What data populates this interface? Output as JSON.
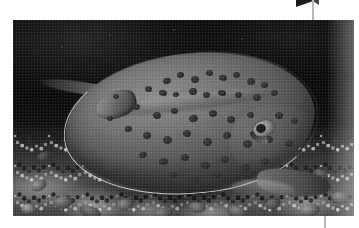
{
  "page": {
    "background_color": "#ffffff",
    "width": 359,
    "height": 228
  },
  "decorations": {
    "corner_rule_color": "#b9b9b9",
    "corner_wedge_color": "#1c1c1c",
    "bottom_rule_color": "#b9b9b9"
  },
  "photo": {
    "name": "blue-spotted-stingray-on-reef",
    "style": "grayscale underwater photograph",
    "frame": {
      "x": 13,
      "y": 20,
      "width": 341,
      "height": 196
    },
    "background_color": "#0a0a0a",
    "subject": {
      "name": "stingray",
      "body_color": "#747474",
      "edge_color": "#e2e2e2",
      "spot_color": "#2a2a2a",
      "eye_color": "#c9c9c9"
    },
    "seabed": {
      "name": "coral-rubble-seabed",
      "color": "#4c4c4c"
    },
    "spots": [
      {
        "x": 150,
        "y": 58,
        "w": 8,
        "h": 6
      },
      {
        "x": 164,
        "y": 52,
        "w": 7,
        "h": 6
      },
      {
        "x": 178,
        "y": 56,
        "w": 8,
        "h": 7
      },
      {
        "x": 193,
        "y": 50,
        "w": 7,
        "h": 6
      },
      {
        "x": 206,
        "y": 55,
        "w": 8,
        "h": 6
      },
      {
        "x": 220,
        "y": 52,
        "w": 7,
        "h": 6
      },
      {
        "x": 234,
        "y": 58,
        "w": 8,
        "h": 7
      },
      {
        "x": 248,
        "y": 62,
        "w": 7,
        "h": 6
      },
      {
        "x": 132,
        "y": 66,
        "w": 7,
        "h": 6
      },
      {
        "x": 146,
        "y": 70,
        "w": 8,
        "h": 6
      },
      {
        "x": 160,
        "y": 72,
        "w": 6,
        "h": 5
      },
      {
        "x": 176,
        "y": 68,
        "w": 8,
        "h": 7
      },
      {
        "x": 190,
        "y": 72,
        "w": 7,
        "h": 6
      },
      {
        "x": 205,
        "y": 70,
        "w": 8,
        "h": 6
      },
      {
        "x": 222,
        "y": 72,
        "w": 7,
        "h": 6
      },
      {
        "x": 240,
        "y": 74,
        "w": 8,
        "h": 7
      },
      {
        "x": 258,
        "y": 70,
        "w": 7,
        "h": 6
      },
      {
        "x": 120,
        "y": 84,
        "w": 7,
        "h": 6
      },
      {
        "x": 140,
        "y": 92,
        "w": 8,
        "h": 7
      },
      {
        "x": 158,
        "y": 88,
        "w": 7,
        "h": 6
      },
      {
        "x": 176,
        "y": 95,
        "w": 9,
        "h": 7
      },
      {
        "x": 196,
        "y": 90,
        "w": 8,
        "h": 7
      },
      {
        "x": 214,
        "y": 96,
        "w": 8,
        "h": 7
      },
      {
        "x": 234,
        "y": 92,
        "w": 7,
        "h": 6
      },
      {
        "x": 262,
        "y": 92,
        "w": 8,
        "h": 7
      },
      {
        "x": 278,
        "y": 98,
        "w": 7,
        "h": 6
      },
      {
        "x": 112,
        "y": 106,
        "w": 7,
        "h": 6
      },
      {
        "x": 130,
        "y": 112,
        "w": 8,
        "h": 7
      },
      {
        "x": 150,
        "y": 116,
        "w": 9,
        "h": 8
      },
      {
        "x": 170,
        "y": 110,
        "w": 8,
        "h": 7
      },
      {
        "x": 190,
        "y": 118,
        "w": 9,
        "h": 8
      },
      {
        "x": 210,
        "y": 112,
        "w": 8,
        "h": 7
      },
      {
        "x": 230,
        "y": 120,
        "w": 9,
        "h": 8
      },
      {
        "x": 252,
        "y": 116,
        "w": 8,
        "h": 7
      },
      {
        "x": 272,
        "y": 120,
        "w": 8,
        "h": 7
      },
      {
        "x": 126,
        "y": 132,
        "w": 8,
        "h": 6
      },
      {
        "x": 146,
        "y": 138,
        "w": 9,
        "h": 7
      },
      {
        "x": 168,
        "y": 134,
        "w": 8,
        "h": 7
      },
      {
        "x": 188,
        "y": 142,
        "w": 9,
        "h": 7
      },
      {
        "x": 208,
        "y": 136,
        "w": 8,
        "h": 7
      },
      {
        "x": 228,
        "y": 144,
        "w": 9,
        "h": 7
      },
      {
        "x": 248,
        "y": 138,
        "w": 8,
        "h": 7
      },
      {
        "x": 156,
        "y": 152,
        "w": 8,
        "h": 6
      },
      {
        "x": 178,
        "y": 156,
        "w": 8,
        "h": 6
      },
      {
        "x": 200,
        "y": 152,
        "w": 8,
        "h": 6
      },
      {
        "x": 94,
        "y": 96,
        "w": 6,
        "h": 5
      },
      {
        "x": 100,
        "y": 74,
        "w": 6,
        "h": 5
      }
    ],
    "specks": [
      {
        "x": 96,
        "y": 14,
        "s": 2
      },
      {
        "x": 160,
        "y": 9,
        "s": 2
      },
      {
        "x": 228,
        "y": 18,
        "s": 2
      },
      {
        "x": 270,
        "y": 12,
        "s": 1
      },
      {
        "x": 48,
        "y": 26,
        "s": 2
      },
      {
        "x": 300,
        "y": 30,
        "s": 1
      }
    ],
    "rubble": [
      {
        "x": 18,
        "y": 160,
        "w": 16,
        "h": 11,
        "c": "#9c9c9c"
      },
      {
        "x": 40,
        "y": 176,
        "w": 20,
        "h": 13,
        "c": "#8a8a8a"
      },
      {
        "x": 8,
        "y": 184,
        "w": 14,
        "h": 10,
        "c": "#b4b4b4"
      },
      {
        "x": 66,
        "y": 186,
        "w": 22,
        "h": 12,
        "c": "#7c7c7c"
      },
      {
        "x": 104,
        "y": 178,
        "w": 18,
        "h": 12,
        "c": "#9a9a9a"
      },
      {
        "x": 140,
        "y": 188,
        "w": 20,
        "h": 11,
        "c": "#868686"
      },
      {
        "x": 176,
        "y": 182,
        "w": 17,
        "h": 11,
        "c": "#a2a2a2"
      },
      {
        "x": 214,
        "y": 186,
        "w": 19,
        "h": 12,
        "c": "#909090"
      },
      {
        "x": 252,
        "y": 178,
        "w": 16,
        "h": 11,
        "c": "#7a7a7a"
      },
      {
        "x": 286,
        "y": 184,
        "w": 21,
        "h": 13,
        "c": "#9e9e9e"
      },
      {
        "x": 318,
        "y": 172,
        "w": 18,
        "h": 12,
        "c": "#888888"
      },
      {
        "x": 300,
        "y": 150,
        "w": 15,
        "h": 10,
        "c": "#6f6f6f"
      },
      {
        "x": 24,
        "y": 132,
        "w": 14,
        "h": 9,
        "c": "#5e5e5e"
      }
    ]
  }
}
